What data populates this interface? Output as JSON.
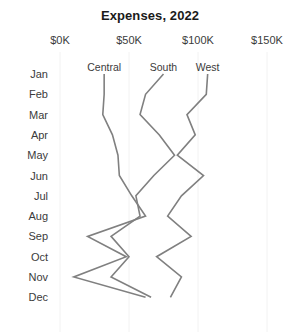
{
  "chart_data": {
    "type": "line",
    "title": "Expenses, 2022",
    "xlabel": "",
    "ylabel": "",
    "orientation": "horizontal",
    "grid": true,
    "legend_position": "top-inline-labels",
    "xlim": [
      0,
      175
    ],
    "x_unit": "$K",
    "xticks": [
      0,
      50,
      100,
      150
    ],
    "xticklabels": [
      "$0K",
      "$50K",
      "$100K",
      "$150K"
    ],
    "categories": [
      "Jan",
      "Feb",
      "Mar",
      "Apr",
      "May",
      "Jun",
      "Jul",
      "Aug",
      "Sep",
      "Oct",
      "Nov",
      "Dec"
    ],
    "series": [
      {
        "name": "Central",
        "color": "#808080",
        "values": [
          32,
          32,
          31,
          38,
          42,
          43,
          52,
          62,
          20,
          48,
          10,
          62
        ]
      },
      {
        "name": "South",
        "color": "#808080",
        "values": [
          75,
          62,
          58,
          72,
          83,
          68,
          55,
          58,
          37,
          50,
          37,
          66
        ]
      },
      {
        "name": "West",
        "color": "#808080",
        "values": [
          107,
          106,
          92,
          98,
          85,
          104,
          88,
          78,
          95,
          70,
          88,
          80
        ]
      }
    ]
  },
  "axis": {
    "x_ticks": [
      {
        "label": "$0K",
        "value": 0
      },
      {
        "label": "$50K",
        "value": 50
      },
      {
        "label": "$100K",
        "value": 100
      },
      {
        "label": "$150K",
        "value": 150
      }
    ],
    "y_ticks": [
      {
        "label": "Jan"
      },
      {
        "label": "Feb"
      },
      {
        "label": "Mar"
      },
      {
        "label": "Apr"
      },
      {
        "label": "May"
      },
      {
        "label": "Jun"
      },
      {
        "label": "Jul"
      },
      {
        "label": "Aug"
      },
      {
        "label": "Sep"
      },
      {
        "label": "Oct"
      },
      {
        "label": "Nov"
      },
      {
        "label": "Dec"
      }
    ]
  },
  "series_labels": [
    {
      "name": "Central"
    },
    {
      "name": "South"
    },
    {
      "name": "West"
    }
  ],
  "colors": {
    "line": "#808080",
    "grid": "#f2f2f2",
    "text": "#3b3b3b",
    "title": "#1a1a1a",
    "background": "#ffffff"
  }
}
